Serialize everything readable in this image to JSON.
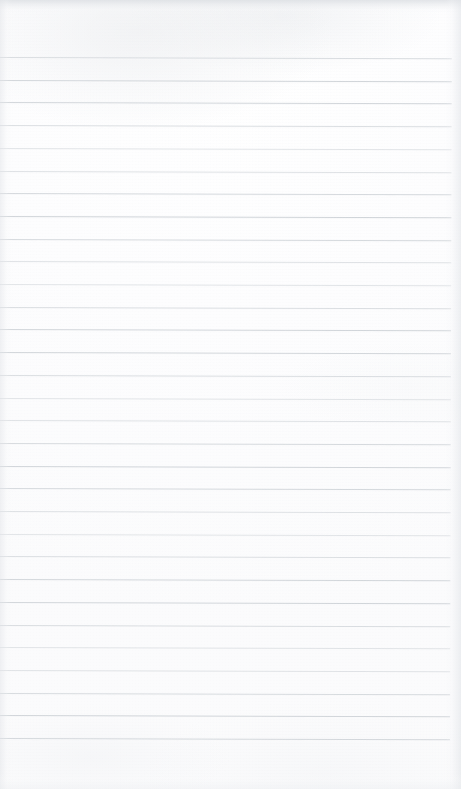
{
  "document": {
    "kind": "scanned-page",
    "title": "Blank ruled notepad page",
    "content_text": "",
    "handwriting": "none",
    "printed_text": "none",
    "page_width_px": 461,
    "page_height_px": 789,
    "orientation": "portrait"
  },
  "paper": {
    "background_color": "#ffffff",
    "tint_color": "#fdfdfe",
    "vignette_color": "#e8eaed",
    "top_edge_shadow_color": "#dde0e4",
    "top_edge_shadow_height_px": 13
  },
  "ruling": {
    "style": "horizontal-ruled",
    "line_color": "#c9ced3",
    "line_thickness_px": 1,
    "line_spacing_px": 22.7,
    "first_line_y_px": 57,
    "last_line_y_px": 738,
    "line_count": 31,
    "left_inset_px": 0,
    "right_inset_px": 9,
    "margin_rule": "none",
    "skew_degrees": 0.16,
    "line_y_positions": [
      57,
      79.7,
      102.4,
      125.1,
      147.8,
      170.5,
      193.2,
      215.9,
      238.6,
      261.3,
      284,
      306.7,
      329.4,
      352.1,
      374.8,
      397.5,
      420.2,
      442.9,
      465.6,
      488.3,
      511,
      533.7,
      556.4,
      579.1,
      601.8,
      624.5,
      647.2,
      669.9,
      692.6,
      715.3,
      738
    ]
  },
  "regions": {
    "header_blank_label": "",
    "header_blank_height_px": 57,
    "footer_blank_label": "",
    "footer_blank_height_px": 51
  }
}
